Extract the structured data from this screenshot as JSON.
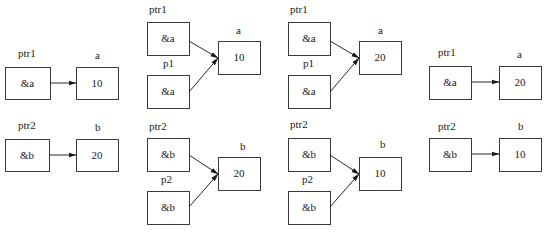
{
  "styles": {
    "stroke": "#3a3a3a",
    "text": "#1a1a1a",
    "background": "#ffffff"
  },
  "panels": [
    {
      "id": "panel-1",
      "boxes": [
        {
          "id": "ptr1",
          "label": "ptr1",
          "value": "&a",
          "x": 5,
          "y": 67,
          "w": 45,
          "h": 32,
          "label_x": 18,
          "label_y": 57
        },
        {
          "id": "a",
          "label": "a",
          "value": "10",
          "x": 76,
          "y": 67,
          "w": 42,
          "h": 32,
          "label_x": 95,
          "label_y": 59
        },
        {
          "id": "ptr2",
          "label": "ptr2",
          "value": "&b",
          "x": 5,
          "y": 139,
          "w": 44,
          "h": 32,
          "label_x": 18,
          "label_y": 129
        },
        {
          "id": "b",
          "label": "b",
          "value": "20",
          "x": 76,
          "y": 139,
          "w": 42,
          "h": 32,
          "label_x": 95,
          "label_y": 131
        }
      ],
      "arrows": [
        {
          "from": "ptr1",
          "to": "a",
          "x1": 50,
          "y1": 83,
          "x2": 76,
          "y2": 83
        },
        {
          "from": "ptr2",
          "to": "b",
          "x1": 49,
          "y1": 155,
          "x2": 76,
          "y2": 155
        }
      ]
    },
    {
      "id": "panel-2",
      "boxes": [
        {
          "id": "ptr1",
          "label": "ptr1",
          "value": "&a",
          "x": 147,
          "y": 22,
          "w": 42,
          "h": 33,
          "label_x": 149,
          "label_y": 13
        },
        {
          "id": "p1",
          "label": "p1",
          "value": "&a",
          "x": 147,
          "y": 75,
          "w": 42,
          "h": 33,
          "label_x": 163,
          "label_y": 67
        },
        {
          "id": "a",
          "label": "a",
          "value": "10",
          "x": 218,
          "y": 41,
          "w": 42,
          "h": 33,
          "label_x": 236,
          "label_y": 34
        },
        {
          "id": "ptr2",
          "label": "ptr2",
          "value": "&b",
          "x": 147,
          "y": 138,
          "w": 42,
          "h": 33,
          "label_x": 149,
          "label_y": 130
        },
        {
          "id": "p2",
          "label": "p2",
          "value": "&b",
          "x": 147,
          "y": 191,
          "w": 42,
          "h": 33,
          "label_x": 161,
          "label_y": 183
        },
        {
          "id": "b",
          "label": "b",
          "value": "20",
          "x": 218,
          "y": 157,
          "w": 42,
          "h": 33,
          "label_x": 240,
          "label_y": 150
        }
      ],
      "arrows": [
        {
          "from": "ptr1",
          "to": "a",
          "x1": 189,
          "y1": 41,
          "x2": 218,
          "y2": 58
        },
        {
          "from": "p1",
          "to": "a",
          "x1": 189,
          "y1": 92,
          "x2": 218,
          "y2": 58
        },
        {
          "from": "ptr2",
          "to": "b",
          "x1": 189,
          "y1": 155,
          "x2": 218,
          "y2": 174
        },
        {
          "from": "p2",
          "to": "b",
          "x1": 189,
          "y1": 207,
          "x2": 218,
          "y2": 174
        }
      ]
    },
    {
      "id": "panel-3",
      "boxes": [
        {
          "id": "ptr1",
          "label": "ptr1",
          "value": "&a",
          "x": 288,
          "y": 22,
          "w": 42,
          "h": 33,
          "label_x": 290,
          "label_y": 13
        },
        {
          "id": "p1",
          "label": "p1",
          "value": "&a",
          "x": 288,
          "y": 75,
          "w": 42,
          "h": 33,
          "label_x": 303,
          "label_y": 67
        },
        {
          "id": "a",
          "label": "a",
          "value": "20",
          "x": 359,
          "y": 41,
          "w": 42,
          "h": 33,
          "label_x": 378,
          "label_y": 34
        },
        {
          "id": "ptr2",
          "label": "ptr2",
          "value": "&b",
          "x": 288,
          "y": 138,
          "w": 42,
          "h": 33,
          "label_x": 290,
          "label_y": 128
        },
        {
          "id": "p2",
          "label": "p2",
          "value": "&b",
          "x": 288,
          "y": 191,
          "w": 42,
          "h": 33,
          "label_x": 302,
          "label_y": 183
        },
        {
          "id": "b",
          "label": "b",
          "value": "10",
          "x": 359,
          "y": 157,
          "w": 42,
          "h": 33,
          "label_x": 380,
          "label_y": 148
        }
      ],
      "arrows": [
        {
          "from": "ptr1",
          "to": "a",
          "x1": 330,
          "y1": 41,
          "x2": 359,
          "y2": 58
        },
        {
          "from": "p1",
          "to": "a",
          "x1": 330,
          "y1": 92,
          "x2": 359,
          "y2": 58
        },
        {
          "from": "ptr2",
          "to": "b",
          "x1": 330,
          "y1": 155,
          "x2": 359,
          "y2": 174
        },
        {
          "from": "p2",
          "to": "b",
          "x1": 330,
          "y1": 207,
          "x2": 359,
          "y2": 174
        }
      ]
    },
    {
      "id": "panel-4",
      "boxes": [
        {
          "id": "ptr1",
          "label": "ptr1",
          "value": "&a",
          "x": 429,
          "y": 66,
          "w": 42,
          "h": 33,
          "label_x": 438,
          "label_y": 56
        },
        {
          "id": "a",
          "label": "a",
          "value": "20",
          "x": 499,
          "y": 66,
          "w": 42,
          "h": 33,
          "label_x": 517,
          "label_y": 58
        },
        {
          "id": "ptr2",
          "label": "ptr2",
          "value": "&b",
          "x": 429,
          "y": 138,
          "w": 42,
          "h": 33,
          "label_x": 438,
          "label_y": 130
        },
        {
          "id": "b",
          "label": "b",
          "value": "10",
          "x": 499,
          "y": 138,
          "w": 42,
          "h": 33,
          "label_x": 518,
          "label_y": 130
        }
      ],
      "arrows": [
        {
          "from": "ptr1",
          "to": "a",
          "x1": 471,
          "y1": 82,
          "x2": 499,
          "y2": 82
        },
        {
          "from": "ptr2",
          "to": "b",
          "x1": 471,
          "y1": 154,
          "x2": 499,
          "y2": 154
        }
      ]
    }
  ]
}
